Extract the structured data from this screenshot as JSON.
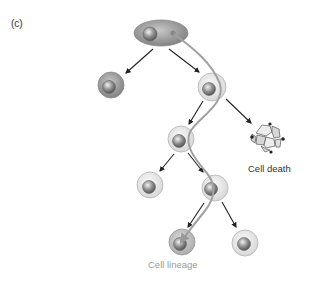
{
  "panel_label": "(c)",
  "labels": {
    "cell_death": "Cell death",
    "cell_lineage": "Cell lineage"
  },
  "colors": {
    "arrow": "#222222",
    "lineage_path": "#a0a0a0",
    "cell_dark": "#8a8a8a",
    "cell_medium": "#bdbdbd",
    "cell_light": "#e6e6e6",
    "nucleus": "#777777",
    "lineage_text": "#9a9a9a"
  },
  "cells": [
    {
      "id": "root",
      "shape": "ellipse",
      "shade": "dark"
    },
    {
      "id": "gen2-left",
      "shade": "dark"
    },
    {
      "id": "gen2-right",
      "shade": "light"
    },
    {
      "id": "gen3",
      "shade": "light"
    },
    {
      "id": "dying",
      "state": "apoptotic"
    },
    {
      "id": "gen4-left",
      "shade": "light"
    },
    {
      "id": "gen4-right",
      "shade": "light"
    },
    {
      "id": "gen5-left",
      "shade": "medium"
    },
    {
      "id": "gen5-right",
      "shade": "light"
    }
  ]
}
